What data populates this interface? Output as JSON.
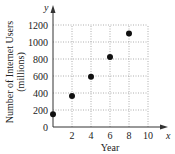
{
  "chart_data": {
    "type": "scatter",
    "title": "",
    "xlabel": "Year",
    "ylabel": "Number of Internet Users (millions)",
    "ylabel_lines": [
      "Number of Internet Users",
      "(millions)"
    ],
    "x_axis_symbol": "x",
    "y_axis_symbol": "y",
    "x": [
      0,
      2,
      4,
      6,
      8
    ],
    "y": [
      150,
      365,
      590,
      825,
      1100
    ],
    "xlim": [
      0,
      10
    ],
    "ylim": [
      0,
      1200
    ],
    "x_ticks": [
      2,
      4,
      6,
      8,
      10
    ],
    "x_tick_labels": [
      "2",
      "4",
      "6",
      "8",
      "10"
    ],
    "y_ticks": [
      0,
      200,
      400,
      600,
      800,
      1000,
      1200
    ],
    "y_tick_labels": [
      "0",
      "200",
      "400",
      "600",
      "800",
      "1000",
      "1200"
    ],
    "grid": true,
    "grid_style": "dotted",
    "legend": null
  },
  "style": {
    "point_color": "#111111",
    "axis_color": "#333333",
    "grid_color": "#999999"
  }
}
